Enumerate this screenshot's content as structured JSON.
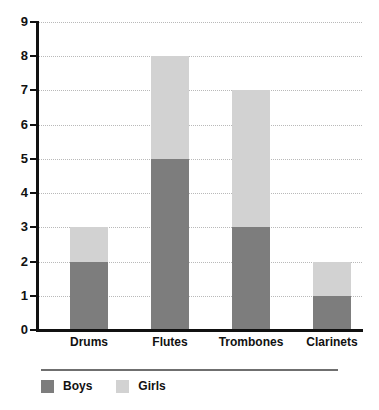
{
  "chart_data": {
    "type": "bar",
    "stacked": true,
    "title": "",
    "subtitle": "",
    "xlabel": "",
    "ylabel": "",
    "categories": [
      "Drums",
      "Flutes",
      "Trombones",
      "Clarinets"
    ],
    "series": [
      {
        "name": "Boys",
        "values": [
          2,
          5,
          3,
          1
        ],
        "color": "#7d7d7d"
      },
      {
        "name": "Girls",
        "values": [
          1,
          3,
          4,
          1
        ],
        "color": "#d2d2d2"
      }
    ],
    "totals": [
      3,
      8,
      7,
      2
    ],
    "ylim": [
      0,
      9
    ],
    "ytick_labels": [
      "0",
      "1",
      "2",
      "3",
      "4",
      "5",
      "6",
      "7",
      "8",
      "9"
    ],
    "ytick_values": [
      0,
      1,
      2,
      3,
      4,
      5,
      6,
      7,
      8,
      9
    ],
    "grid": true,
    "grid_style": "dotted",
    "grid_color": "#b9b9b9",
    "axis_color": "#111111",
    "background": "#ffffff",
    "legend_position": "bottom-left",
    "legend_entries": [
      "Boys",
      "Girls"
    ]
  }
}
